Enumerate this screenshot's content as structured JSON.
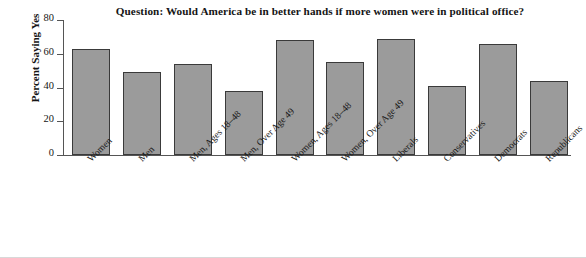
{
  "chart_data": {
    "type": "bar",
    "title": "Question: Would America be in better hands if more women were in political office?",
    "xlabel": "",
    "ylabel": "Percent Saying Yes",
    "ylim": [
      0,
      80
    ],
    "yticks": [
      0,
      20,
      40,
      60,
      80
    ],
    "grid": false,
    "legend": "none",
    "bar_color": "#9b9b9b",
    "bar_edge_color": "#3a3a3a",
    "categories": [
      "Women",
      "Men",
      "Men, Ages 18–48",
      "Men, Over Age 49",
      "Women, Ages 18–48",
      "Women, Over Age 49",
      "Liberals",
      "Conservatives",
      "Democrats",
      "Republicans"
    ],
    "values": [
      63,
      49,
      54,
      38,
      68,
      55,
      69,
      41,
      66,
      44
    ]
  },
  "axis": {
    "y_tick_labels": [
      "0",
      "20",
      "40",
      "60",
      "80"
    ]
  }
}
